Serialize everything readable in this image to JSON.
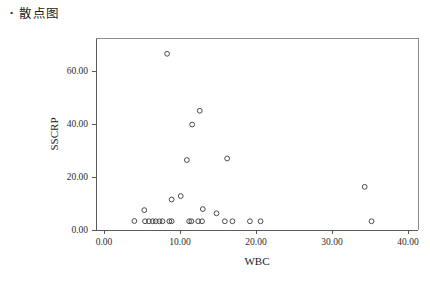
{
  "heading": {
    "bullet": "•",
    "text": "散点图"
  },
  "chart_data": {
    "type": "scatter",
    "title": "",
    "xlabel": "WBC",
    "ylabel": "SSCRP",
    "xlim": [
      0.0,
      40.0
    ],
    "ylim": [
      0.0,
      70.0
    ],
    "xticks": [
      0.0,
      10.0,
      20.0,
      30.0,
      40.0
    ],
    "yticks": [
      0.0,
      20.0,
      40.0,
      60.0
    ],
    "xtick_labels": [
      "0.00",
      "10.00",
      "20.00",
      "30.00",
      "40.00"
    ],
    "ytick_labels": [
      "0.00",
      "20.00",
      "40.00",
      "60.00"
    ],
    "grid": false,
    "legend": null,
    "marker": "open-circle",
    "marker_color": "#4a4a4a",
    "points": [
      {
        "x": 8.3,
        "y": 66.5
      },
      {
        "x": 12.6,
        "y": 45.0
      },
      {
        "x": 11.6,
        "y": 39.8
      },
      {
        "x": 16.2,
        "y": 27.0
      },
      {
        "x": 10.9,
        "y": 26.4
      },
      {
        "x": 34.3,
        "y": 16.3
      },
      {
        "x": 10.1,
        "y": 12.8
      },
      {
        "x": 8.9,
        "y": 11.5
      },
      {
        "x": 13.0,
        "y": 7.9
      },
      {
        "x": 5.3,
        "y": 7.5
      },
      {
        "x": 14.8,
        "y": 6.3
      },
      {
        "x": 4.0,
        "y": 3.4
      },
      {
        "x": 5.4,
        "y": 3.3
      },
      {
        "x": 5.9,
        "y": 3.3
      },
      {
        "x": 6.4,
        "y": 3.3
      },
      {
        "x": 6.8,
        "y": 3.3
      },
      {
        "x": 7.3,
        "y": 3.3
      },
      {
        "x": 7.7,
        "y": 3.3
      },
      {
        "x": 8.6,
        "y": 3.3
      },
      {
        "x": 8.9,
        "y": 3.3
      },
      {
        "x": 11.2,
        "y": 3.3
      },
      {
        "x": 11.5,
        "y": 3.3
      },
      {
        "x": 12.4,
        "y": 3.3
      },
      {
        "x": 12.9,
        "y": 3.3
      },
      {
        "x": 15.9,
        "y": 3.3
      },
      {
        "x": 16.9,
        "y": 3.3
      },
      {
        "x": 19.2,
        "y": 3.3
      },
      {
        "x": 20.6,
        "y": 3.3
      },
      {
        "x": 35.2,
        "y": 3.3
      }
    ]
  },
  "geometry": {
    "plot_left": 96,
    "plot_right": 418,
    "plot_top": 38,
    "plot_bottom": 230,
    "x_zero_px": 104,
    "x_unit_px": 7.6,
    "y_zero_px": 230,
    "y_unit_px": 2.65,
    "marker_radius": 2.4
  }
}
